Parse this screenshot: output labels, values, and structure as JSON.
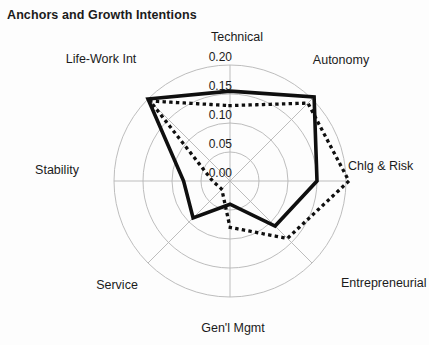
{
  "title": "Anchors and Growth Intentions",
  "chart_data": {
    "type": "radar",
    "title": "Anchors and Growth Intentions",
    "categories": [
      "Technical",
      "Autonomy",
      "Chlg & Risk",
      "Entrepreneurial",
      "Gen'l Mgmt",
      "Service",
      "Stability",
      "Life-Work Int"
    ],
    "series": [
      {
        "name": "solid",
        "style": "solid",
        "values": [
          0.155,
          0.205,
          0.15,
          0.11,
          0.04,
          0.09,
          0.08,
          0.2
        ]
      },
      {
        "name": "dotted",
        "style": "dotted",
        "values": [
          0.13,
          0.19,
          0.205,
          0.14,
          0.08,
          0.02,
          0.03,
          0.195
        ]
      }
    ],
    "r_axis": {
      "min": 0,
      "max": 0.2,
      "tick_values": [
        0,
        0.05,
        0.1,
        0.15,
        0.2
      ],
      "ticks": [
        "0.00",
        "0.05",
        "0.10",
        "0.15",
        "0.20"
      ]
    },
    "grid": true,
    "legend": "none",
    "colors": {
      "line": "#0f0f0f",
      "grid": "#b5b5b5",
      "text": "#1b1b1b",
      "background": "#fdfdfd"
    }
  }
}
